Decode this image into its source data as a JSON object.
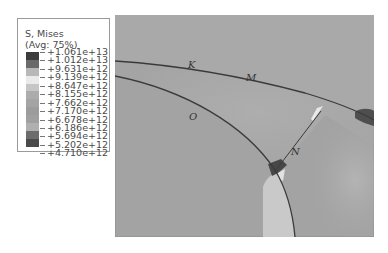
{
  "legend": {
    "title": "S, Mises",
    "subtitle": "(Avg: 75%)",
    "entries": [
      {
        "label": "+1.061e+13",
        "color": "#3c3c3c"
      },
      {
        "label": "+1.012e+13",
        "color": "#6a6a6a"
      },
      {
        "label": "+9.631e+12",
        "color": "#b8b8b8"
      },
      {
        "label": "+9.139e+12",
        "color": "#eaeaea"
      },
      {
        "label": "+8.647e+12",
        "color": "#c6c6c6"
      },
      {
        "label": "+8.155e+12",
        "color": "#acacac"
      },
      {
        "label": "+7.662e+12",
        "color": "#a4a4a4"
      },
      {
        "label": "+7.170e+12",
        "color": "#9c9c9c"
      },
      {
        "label": "+6.678e+12",
        "color": "#a0a0a0"
      },
      {
        "label": "+6.186e+12",
        "color": "#b0b0b0"
      },
      {
        "label": "+5.694e+12",
        "color": "#6c6c6c"
      },
      {
        "label": "+5.202e+12",
        "color": "#4a4a4a"
      },
      {
        "label": "+4.710e+12",
        "color": "#2e2e2e"
      }
    ]
  },
  "plot": {
    "labels": {
      "K": "K",
      "M": "M",
      "O": "O",
      "N": "N"
    },
    "colors": {
      "background": "#a4a4a4",
      "edge": "#3a3a3a",
      "hot_spot": "#484848",
      "light_region": "#c8c8c8"
    }
  }
}
